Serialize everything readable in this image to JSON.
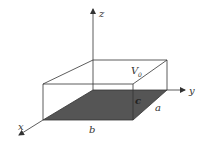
{
  "diagram": {
    "type": "3d-box-potential",
    "axes": {
      "x": {
        "label": "x"
      },
      "y": {
        "label": "y"
      },
      "z": {
        "label": "z"
      }
    },
    "labels": {
      "potential": "V",
      "potential_sub": "0",
      "width": "b",
      "depth": "a",
      "charge_or_height": "c"
    },
    "colors": {
      "line": "#333333",
      "base_fill": "#555555",
      "background": "#ffffff"
    }
  }
}
